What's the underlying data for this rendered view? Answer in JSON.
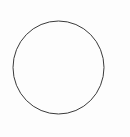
{
  "canvas": {
    "width": 130,
    "height": 137,
    "background_color": "#fdfdfd",
    "title": "circle-line-drawing",
    "description": "A single unfilled thin-outlined circle centered on a plain white canvas."
  },
  "shapes": [
    {
      "kind": "circle",
      "name": "outline-circle",
      "center_x": 58.5,
      "center_y": 67.5,
      "radius_x": 45.5,
      "radius_y": 46.5,
      "stroke_color": "#3a3a3a",
      "stroke_width": 1,
      "fill": "none",
      "left_edge_x": 13,
      "right_edge_x": 104,
      "top_edge_y": 21,
      "bottom_edge_y": 114
    }
  ]
}
